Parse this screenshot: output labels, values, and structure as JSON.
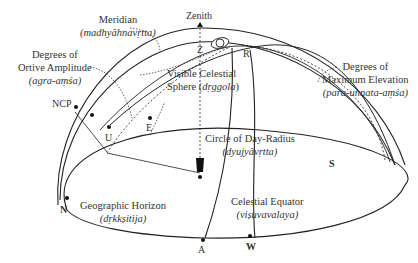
{
  "diagram": {
    "type": "celestial-sphere",
    "labels": {
      "meridian": {
        "title": "Meridian",
        "sanskrit": "(madhyāhnavṛtta)"
      },
      "ortive": {
        "line1": "Degrees of",
        "line2": "Ortive Amplitude",
        "sanskrit": "(agra-aṃśa)"
      },
      "visible_sphere": {
        "line1": "Visible Celestial",
        "line2": "Sphere (",
        "sanskrit": "dṛggola",
        "close": ")"
      },
      "max_elevation": {
        "line1": "Degrees of",
        "line2": "Maximum Elevation",
        "sanskrit": "(para-unnata-aṃśa)"
      },
      "day_radius": {
        "title": "Circle of Day-Radius",
        "sanskrit": "(dyujyāvṛtta)"
      },
      "horizon": {
        "title": "Geographic Horizon",
        "sanskrit": "(dṛkkṣitija)"
      },
      "equator": {
        "title": "Celestial Equator",
        "sanskrit": "(viṣuvavalaya)"
      }
    },
    "points": {
      "zenith": "Zenith",
      "z": "Z",
      "r": "R",
      "ncp": "NCP",
      "u": "U",
      "e": "E",
      "n": "N",
      "s": "S",
      "a": "A",
      "w": "W"
    },
    "colors": {
      "stroke": "#222222",
      "background": "#ffffff"
    }
  }
}
